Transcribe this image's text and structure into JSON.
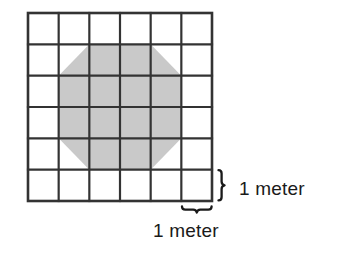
{
  "figure": {
    "type": "geometry-diagram",
    "canvas": {
      "width": 346,
      "height": 262
    },
    "background_color": "#ffffff"
  },
  "grid": {
    "name": "unit-square-grid",
    "columns": 6,
    "rows": 6,
    "cell_width_meters": 1,
    "cell_height_meters": 1,
    "total_width_meters": 6,
    "total_height_meters": 6,
    "line_color": "#333333",
    "line_width_px": 2.2,
    "outer_line_width_px": 2.6,
    "fill_color": "#ffffff",
    "origin_px": {
      "x": 28,
      "y": 13
    },
    "size_px": {
      "width": 184,
      "height": 188
    },
    "cell_size_px": {
      "width": 30.67,
      "height": 31.33
    }
  },
  "shape": {
    "name": "shaded-octagon",
    "type": "octagon",
    "fill_color": "#c9c9c9",
    "stroke": "none",
    "description": "Regular-ish octagon inscribed in the central 4x4 block of the grid with its four corners cut diagonally across one unit cell each",
    "vertices_grid_units": [
      [
        2,
        1
      ],
      [
        4,
        1
      ],
      [
        5,
        2
      ],
      [
        5,
        4
      ],
      [
        4,
        5
      ],
      [
        2,
        5
      ],
      [
        1,
        4
      ],
      [
        1,
        2
      ]
    ],
    "bounding_box_grid_units": {
      "x": 1,
      "y": 1,
      "width": 4,
      "height": 4
    },
    "area_square_meters": 14
  },
  "annotations": {
    "vertical_brace": {
      "name": "vertical-brace",
      "glyph": "}",
      "orientation": "vertical",
      "spans_cells": 1,
      "color": "#1a1a1a"
    },
    "horizontal_brace": {
      "name": "horizontal-brace",
      "glyph": "}",
      "orientation": "horizontal",
      "spans_cells": 1,
      "color": "#1a1a1a"
    }
  },
  "labels": {
    "right": {
      "name": "vertical-scale-label",
      "text": "1 meter",
      "value": 1,
      "unit": "meter",
      "describes": "height of one grid cell"
    },
    "bottom": {
      "name": "horizontal-scale-label",
      "text": "1 meter",
      "value": 1,
      "unit": "meter",
      "describes": "width of one grid cell"
    }
  }
}
